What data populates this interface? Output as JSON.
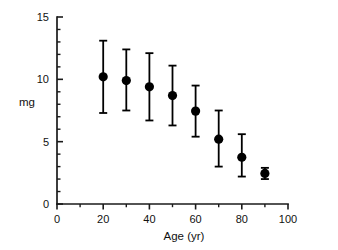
{
  "chart_data": {
    "type": "scatter",
    "title": "",
    "subtitle": "",
    "xlabel": "Age (yr)",
    "ylabel": "mg",
    "xlim": [
      0,
      100
    ],
    "ylim": [
      0,
      15
    ],
    "grid": false,
    "legend": null,
    "x_major_ticks": [
      0,
      20,
      40,
      60,
      80,
      100
    ],
    "x_minor_ticks": [
      10,
      30,
      50,
      70,
      90
    ],
    "x_tick_labels": [
      "0",
      "20",
      "40",
      "60",
      "80",
      "100"
    ],
    "y_major_ticks": [
      0,
      5,
      10,
      15
    ],
    "y_minor_ticks": [
      1,
      2,
      3,
      4,
      6,
      7,
      8,
      9,
      11,
      12,
      13,
      14
    ],
    "y_tick_labels": [
      "0",
      "5",
      "10",
      "15"
    ],
    "marker": "filled-circle",
    "marker_color": "#000000",
    "error_bar_style": "capped-vertical",
    "x": [
      20,
      30,
      40,
      50,
      60,
      70,
      80,
      90
    ],
    "values": [
      10.2,
      9.9,
      9.4,
      8.7,
      7.45,
      5.2,
      3.75,
      2.45
    ],
    "error_low": [
      7.3,
      7.5,
      6.7,
      6.3,
      5.4,
      3.0,
      2.2,
      2.0
    ],
    "error_high": [
      13.1,
      12.4,
      12.1,
      11.1,
      9.5,
      7.5,
      5.6,
      2.9
    ],
    "points": [
      {
        "age": 20,
        "mg": 10.2,
        "low": 7.3,
        "high": 13.1
      },
      {
        "age": 30,
        "mg": 9.9,
        "low": 7.5,
        "high": 12.4
      },
      {
        "age": 40,
        "mg": 9.4,
        "low": 6.7,
        "high": 12.1
      },
      {
        "age": 50,
        "mg": 8.7,
        "low": 6.3,
        "high": 11.1
      },
      {
        "age": 60,
        "mg": 7.45,
        "low": 5.4,
        "high": 9.5
      },
      {
        "age": 70,
        "mg": 5.2,
        "low": 3.0,
        "high": 7.5
      },
      {
        "age": 80,
        "mg": 3.75,
        "low": 2.2,
        "high": 5.6
      },
      {
        "age": 90,
        "mg": 2.45,
        "low": 2.0,
        "high": 2.9
      }
    ]
  },
  "colors": {
    "axis": "#1a1a1a",
    "marker": "#000000",
    "background": "#ffffff",
    "text": "#111111"
  }
}
